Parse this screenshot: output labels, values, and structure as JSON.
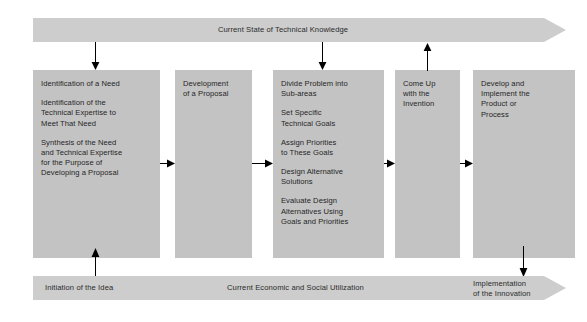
{
  "diagram": {
    "colors": {
      "banner_fill": "#cdcdcd",
      "box_fill": "#c3c3c3",
      "text": "#262626",
      "arrow": "#000000",
      "background": "#ffffff"
    },
    "top_banner": {
      "label": "Current State of Technical Knowledge",
      "direction": "right"
    },
    "bottom_banner": {
      "direction": "right",
      "labels": [
        {
          "text": "Initiation of the Idea"
        },
        {
          "text": "Current Economic and Social Utilization"
        },
        {
          "text": "Implementation\nof the Innovation"
        }
      ]
    },
    "boxes": [
      {
        "name": "identification-of-need",
        "paragraphs": [
          "Identification of a Need",
          "Identification of the\nTechnical Expertise to\nMeet That Need",
          "Synthesis of the Need\nand Technical Expertise\nfor the Purpose of\nDeveloping a Proposal"
        ]
      },
      {
        "name": "development-of-proposal",
        "paragraphs": [
          "Development\nof a Proposal"
        ]
      },
      {
        "name": "divide-problem",
        "paragraphs": [
          "Divide Problem into\nSub-areas",
          "Set Specific\nTechnical Goals",
          "Assign Priorities\nto These Goals",
          "Design Alternative\nSolutions",
          "Evaluate Design\nAlternatives Using\nGoals and Priorities"
        ]
      },
      {
        "name": "come-up-with-invention",
        "paragraphs": [
          "Come Up\nwith the\nInvention"
        ]
      },
      {
        "name": "develop-and-implement",
        "paragraphs": [
          "Develop and\nImplement the\nProduct or\nProcess"
        ]
      }
    ],
    "connectors": [
      {
        "name": "arrow-knowledge-to-need",
        "direction": "down"
      },
      {
        "name": "arrow-knowledge-to-divide",
        "direction": "down"
      },
      {
        "name": "arrow-invention-to-knowledge",
        "direction": "up"
      },
      {
        "name": "arrow-need-to-proposal",
        "direction": "right"
      },
      {
        "name": "arrow-proposal-to-divide",
        "direction": "right"
      },
      {
        "name": "arrow-divide-to-invention",
        "direction": "right"
      },
      {
        "name": "arrow-invention-to-develop",
        "direction": "right"
      },
      {
        "name": "arrow-idea-to-need",
        "direction": "up"
      },
      {
        "name": "arrow-develop-to-innovation",
        "direction": "down"
      }
    ]
  }
}
